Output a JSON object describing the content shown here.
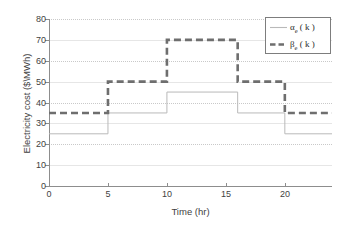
{
  "chart_data": {
    "type": "line",
    "subtype": "step",
    "title": "",
    "xlabel": "Time (hr)",
    "ylabel": "Electricity cost ($\\MWh)",
    "xlim": [
      0,
      24
    ],
    "ylim": [
      0,
      80
    ],
    "xticks": [
      0,
      5,
      10,
      15,
      20
    ],
    "yticks": [
      0,
      10,
      20,
      30,
      40,
      50,
      60,
      70,
      80
    ],
    "grid": "horizontal-dotted",
    "legend_position": "upper-right",
    "series": [
      {
        "name": "alpha_e(k)",
        "legend_base": "α",
        "legend_sub": "e",
        "legend_tail": " ( k )",
        "style": "solid",
        "color": "#b9b9b9",
        "width": 1,
        "breakpoints": [
          0,
          5,
          10,
          16,
          20,
          24
        ],
        "values": [
          25,
          35,
          45,
          35,
          25
        ]
      },
      {
        "name": "beta_e(k)",
        "legend_base": "β",
        "legend_sub": "e",
        "legend_tail": " ( k )",
        "style": "dashed",
        "color": "#6e6e6e",
        "width": 2.6,
        "breakpoints": [
          0,
          5,
          10,
          16,
          20,
          24
        ],
        "values": [
          35,
          50,
          70,
          50,
          35
        ]
      }
    ]
  },
  "axis": {
    "ylabel": "Electricity cost ($\\MWh)",
    "xlabel": "Time (hr)",
    "yticks": [
      "0",
      "10",
      "20",
      "30",
      "40",
      "50",
      "60",
      "70",
      "80"
    ],
    "xticks": [
      "0",
      "5",
      "10",
      "15",
      "20"
    ]
  },
  "legend": {
    "entries": [
      {
        "base": "α",
        "sub": "e",
        "tail": " ( k )",
        "style": "solid"
      },
      {
        "base": "β",
        "sub": "e",
        "tail": " ( k )",
        "style": "dashed"
      }
    ]
  },
  "colors": {
    "alpha_line": "#b9b9b9",
    "beta_line": "#6e6e6e",
    "axis": "#8d8d8d",
    "grid": "#c9c9c9",
    "background": "#ffffff",
    "text": "#3f3f3f"
  }
}
